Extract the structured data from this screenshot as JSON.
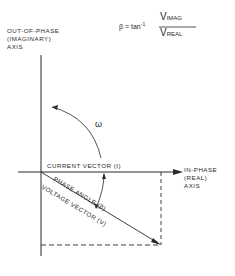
{
  "diagram": {
    "formula": {
      "lhs": "β = tan",
      "exponent": "-1",
      "numerator_main": "V",
      "numerator_sub": "IMAG",
      "denominator_main": "V",
      "denominator_sub": "REAL"
    },
    "axes": {
      "vertical_label": [
        "OUT-OF-PHASE",
        "(IMAGINARY)",
        "AXIS"
      ],
      "horizontal_label": [
        "IN-PHASE",
        "(REAL)",
        "AXIS"
      ]
    },
    "vectors": {
      "current": "CURRENT VECTOR (I)",
      "voltage": "VOLTAGE VECTOR (V)"
    },
    "angle_label": "PHASE ANGLE (β)",
    "rotation_symbol": "ω",
    "colors": {
      "line": "#2a2a2a",
      "background": "#ffffff"
    }
  }
}
